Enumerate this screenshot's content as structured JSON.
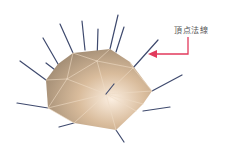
{
  "diagram": {
    "label": "頂点法線",
    "label_pos": [
      174,
      24
    ],
    "colors": {
      "background": "#ffffff",
      "surface_light": "#fbeee0",
      "surface_mid": "#d9bc9c",
      "surface_dark": "#9f8a72",
      "edge": "#efdcc6",
      "normal": "#3f4a6e",
      "arrow": "#e23a5c",
      "label": "#555555"
    },
    "outline": [
      [
        46,
        80
      ],
      [
        58,
        64
      ],
      [
        73,
        53
      ],
      [
        110,
        49
      ],
      [
        130,
        62
      ],
      [
        152,
        91
      ],
      [
        143,
        104
      ],
      [
        136,
        111
      ],
      [
        116,
        130
      ],
      [
        74,
        123
      ],
      [
        48,
        108
      ]
    ],
    "edges": [
      [
        [
          73,
          53
        ],
        [
          67,
          79
        ]
      ],
      [
        [
          67,
          79
        ],
        [
          46,
          80
        ]
      ],
      [
        [
          67,
          79
        ],
        [
          97,
          61
        ]
      ],
      [
        [
          97,
          61
        ],
        [
          110,
          49
        ]
      ],
      [
        [
          97,
          61
        ],
        [
          73,
          53
        ]
      ],
      [
        [
          97,
          61
        ],
        [
          133,
          68
        ]
      ],
      [
        [
          97,
          61
        ],
        [
          106,
          94
        ]
      ],
      [
        [
          67,
          79
        ],
        [
          106,
          94
        ]
      ],
      [
        [
          133,
          68
        ],
        [
          106,
          94
        ]
      ],
      [
        [
          133,
          68
        ],
        [
          152,
          91
        ]
      ],
      [
        [
          106,
          94
        ],
        [
          152,
          91
        ]
      ],
      [
        [
          106,
          94
        ],
        [
          136,
          111
        ]
      ],
      [
        [
          106,
          94
        ],
        [
          116,
          130
        ]
      ],
      [
        [
          106,
          94
        ],
        [
          74,
          123
        ]
      ],
      [
        [
          67,
          79
        ],
        [
          48,
          108
        ]
      ],
      [
        [
          48,
          108
        ],
        [
          106,
          94
        ]
      ],
      [
        [
          74,
          123
        ],
        [
          48,
          108
        ]
      ],
      [
        [
          143,
          104
        ],
        [
          106,
          94
        ]
      ],
      [
        [
          130,
          62
        ],
        [
          133,
          68
        ]
      ]
    ],
    "normals": [
      [
        [
          46,
          80
        ],
        [
          20,
          61
        ]
      ],
      [
        [
          58,
          64
        ],
        [
          43,
          38
        ]
      ],
      [
        [
          67,
          79
        ],
        [
          46,
          63
        ]
      ],
      [
        [
          73,
          53
        ],
        [
          60,
          24
        ]
      ],
      [
        [
          85,
          50
        ],
        [
          82,
          21
        ]
      ],
      [
        [
          97,
          61
        ],
        [
          98,
          29
        ]
      ],
      [
        [
          110,
          49
        ],
        [
          118,
          15
        ]
      ],
      [
        [
          116,
          52
        ],
        [
          124,
          27
        ]
      ],
      [
        [
          133,
          68
        ],
        [
          158,
          40
        ]
      ],
      [
        [
          152,
          91
        ],
        [
          182,
          75
        ]
      ],
      [
        [
          143,
          111
        ],
        [
          170,
          107
        ]
      ],
      [
        [
          116,
          130
        ],
        [
          124,
          142
        ]
      ],
      [
        [
          74,
          123
        ],
        [
          59,
          127
        ]
      ],
      [
        [
          48,
          108
        ],
        [
          17,
          103
        ]
      ],
      [
        [
          106,
          94
        ],
        [
          114,
          84
        ]
      ]
    ],
    "arrow": {
      "path": [
        [
          188,
          37
        ],
        [
          188,
          54
        ],
        [
          152,
          54
        ]
      ],
      "head": [
        [
          148,
          54
        ],
        [
          157,
          50
        ],
        [
          157,
          58
        ]
      ]
    }
  }
}
